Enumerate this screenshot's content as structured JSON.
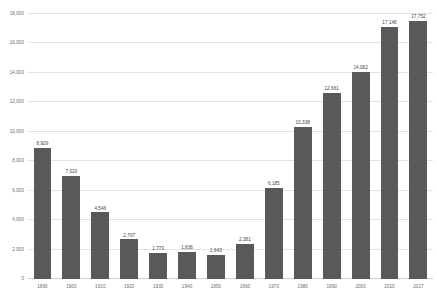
{
  "chart_data": {
    "type": "bar",
    "title": "",
    "subtitle": "",
    "xlabel": "",
    "ylabel": "",
    "categories": [
      "1890",
      "1900",
      "1910",
      "1920",
      "1930",
      "1940",
      "1950",
      "1960",
      "1970",
      "1980",
      "1990",
      "2000",
      "2010",
      "2017"
    ],
    "values": [
      8929,
      7020,
      4546,
      2707,
      1770,
      1836,
      1643,
      2381,
      6185,
      10338,
      12661,
      14062,
      17148,
      17752
    ],
    "value_labels": [
      "8,929",
      "7,020",
      "4,546",
      "2,707",
      "1,770",
      "1,836",
      "1,643",
      "2,381",
      "6,185",
      "10,338",
      "12,661",
      "14,062",
      "17,148",
      "17,752"
    ],
    "ylim": [
      0,
      18000
    ],
    "ytick_values": [
      0,
      2000,
      4000,
      6000,
      8000,
      10000,
      12000,
      14000,
      16000,
      18000
    ],
    "ytick_labels": [
      "0",
      "2,000",
      "4,000",
      "6,000",
      "8,000",
      "10,000",
      "12,000",
      "14,000",
      "16,000",
      "18,000"
    ],
    "grid": true,
    "legend": false,
    "legend_position": "none",
    "bar_color": "#595959",
    "gridline_color": "#e2e2e2",
    "axis_text_color": "#6b6b6b",
    "data_label_color": "#3d3d3d",
    "background_color": "#ffffff"
  }
}
